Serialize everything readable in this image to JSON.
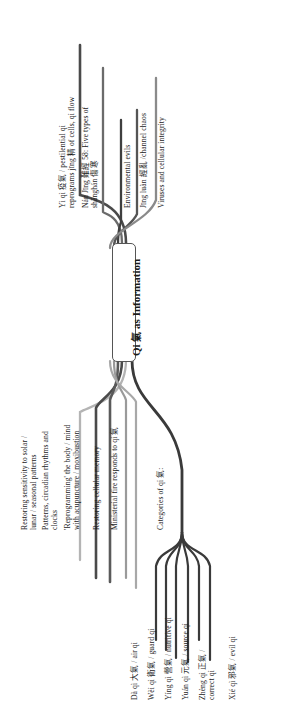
{
  "diagram": {
    "type": "mind-map",
    "orientation": "rotated-90-clockwise",
    "root": {
      "label_pinyin": "Qi",
      "label_han": "氣",
      "label_rest": "as Information",
      "full": "Qi 氣 as Information"
    },
    "branches": [
      {
        "id": "yi-qi",
        "side": "upper",
        "color": "#4a4a4a",
        "text": "Yì qì 疫氣 / pestilential qi reprograms jīng 精 of cells, qi flow",
        "lines": [
          "Yì qì 疫氣 / pestilential qi",
          "reprograms jīng 精 of cells, qi flow"
        ]
      },
      {
        "id": "nan-jing-58",
        "side": "upper",
        "color": "#6b6b6b",
        "text": "Nán Jīng 難經 58: Five types of shānghán 傷寒",
        "lines": [
          "Nán Jīng 難經 58: Five types of",
          "shānghán 傷寒"
        ]
      },
      {
        "id": "environmental-evils",
        "side": "upper",
        "color": "#3f3f3f",
        "text": "Environmental evils",
        "lines": [
          "Environmental evils"
        ]
      },
      {
        "id": "jing-luan",
        "side": "upper",
        "color": "#555555",
        "text": "Jīng luàn 經亂 /channel chaos",
        "lines": [
          "Jīng luàn 經亂 /channel chaos"
        ]
      },
      {
        "id": "viruses-cellular-integrity",
        "side": "upper",
        "color": "#8a8a8a",
        "text": "Viruses and cellular integrity",
        "lines": [
          "Viruses and cellular integrity"
        ]
      },
      {
        "id": "restoring-sensitivity",
        "side": "lower",
        "color": "#b4b4b4",
        "text": "Restoring sensitivity to solar / lunar / seasonal patterns",
        "lines": [
          "Restoring sensitivity to solar /",
          "lunar / seasonal patterns"
        ]
      },
      {
        "id": "patterns-circadian",
        "side": "lower",
        "color": "#4a4a4a",
        "text": "Patterns, circadian rhythms and clocks",
        "lines": [
          "Patterns, circadian rhythms and",
          "clocks"
        ]
      },
      {
        "id": "reprogramming-body-mind",
        "side": "lower",
        "color": "#5a5a5a",
        "text": "'Reprogramming' the body / mind with acupuncture / moxibustion",
        "lines": [
          "'Reprogramming' the body / mind",
          "with acupuncture / moxibustion"
        ]
      },
      {
        "id": "restoring-cellular-memory",
        "side": "lower",
        "color": "#9a9a9a",
        "text": "Restoring cellular memory",
        "lines": [
          "Restoring cellular memory"
        ]
      },
      {
        "id": "ministerial-fire",
        "side": "lower",
        "color": "#a8a8a8",
        "text": "Ministerial fire responds to qi 氣",
        "lines": [
          "Ministerial fire responds to qi 氣"
        ]
      },
      {
        "id": "categories-of-qi",
        "side": "lower",
        "color": "#3a3a3a",
        "text": "Categories of qi 氣:",
        "lines": [
          "Categories of qi 氣:"
        ],
        "children": [
          {
            "id": "da-qi",
            "text": "Dà qì 大氣 / air qi",
            "lines": [
              "Dà qì 大氣 / air qi"
            ]
          },
          {
            "id": "wei-qi",
            "text": "Wèi qì 衛氣 / guard qi",
            "lines": [
              "Wèi qì 衛氣 / guard qi"
            ]
          },
          {
            "id": "ying-qi",
            "text": "Yíng qì 營氣 / nutritive qi",
            "lines": [
              "Yíng qì 營氣 / nutritive qi"
            ]
          },
          {
            "id": "yuan-qi",
            "text": "Yuán qì 元氣 / source qi",
            "lines": [
              "Yuán qì 元氣 / source qi"
            ]
          },
          {
            "id": "zheng-qi",
            "text": "Zhèng qì 正氣 / correct qi",
            "lines": [
              "Zhèng qì 正氣 /",
              "correct qi"
            ]
          },
          {
            "id": "xie-qi",
            "text": "Xié qì 邪氣 / evil qi",
            "lines": [
              "Xié qì 邪氣 / evil qi"
            ]
          }
        ]
      }
    ]
  }
}
